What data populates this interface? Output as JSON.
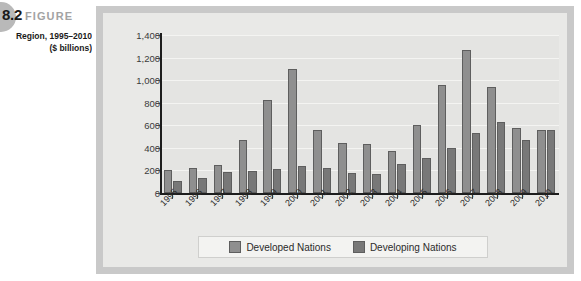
{
  "figure": {
    "number": "8.2",
    "word": "FIGURE",
    "caption_line1": "Region, 1995–2010",
    "caption_line2": "($ billions)"
  },
  "legend": {
    "position": "bottom-center",
    "entries": [
      {
        "label": "Developed Nations",
        "color": "#8f8f8f"
      },
      {
        "label": "Developing Nations",
        "color": "#787878"
      }
    ]
  },
  "chart_data": {
    "type": "bar",
    "title": "",
    "xlabel": "",
    "ylabel": "",
    "ylim": [
      0,
      1400
    ],
    "ytick_values": [
      0,
      200,
      400,
      600,
      800,
      1000,
      1200,
      1400
    ],
    "ytick_labels": [
      "0",
      "200",
      "400",
      "600",
      "800",
      "1,000",
      "1,200",
      "1,400"
    ],
    "grid": true,
    "categories": [
      "1995",
      "1996",
      "1997",
      "1998",
      "1999",
      "2000",
      "2001",
      "2002",
      "2003",
      "2004",
      "2005",
      "2006",
      "2007",
      "2008",
      "2009",
      "2010"
    ],
    "series": [
      {
        "name": "Developed Nations",
        "color": "#8f8f8f",
        "values": [
          205,
          220,
          250,
          470,
          820,
          1100,
          560,
          440,
          430,
          370,
          600,
          960,
          1270,
          935,
          575,
          555
        ]
      },
      {
        "name": "Developing Nations",
        "color": "#787878",
        "values": [
          105,
          135,
          190,
          195,
          215,
          235,
          220,
          175,
          165,
          255,
          310,
          400,
          530,
          625,
          470,
          555
        ]
      }
    ]
  }
}
